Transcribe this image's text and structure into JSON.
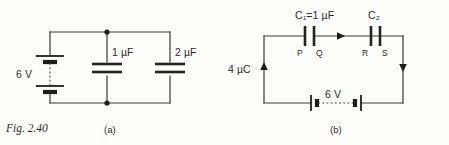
{
  "figure": {
    "caption": "Fig. 2.40",
    "background_color": "#fdfdfc",
    "ink_color": "#2b2b2b"
  },
  "circuit_a": {
    "part_label": "(a)",
    "battery": {
      "voltage_label": "6 V",
      "cells": 2,
      "style": "two-cell-dashed"
    },
    "capacitors": [
      {
        "id": "C-left",
        "value": "1",
        "unit": "µF",
        "label": "1 µF"
      },
      {
        "id": "C-right",
        "value": "2",
        "unit": "µF",
        "label": "2 µF"
      }
    ],
    "nodes": [
      {
        "id": "top-node"
      },
      {
        "id": "bottom-node"
      }
    ],
    "topology": "battery in parallel with 1 uF and 2 uF capacitors"
  },
  "circuit_b": {
    "part_label": "(b)",
    "charge_label": "4 µC",
    "battery": {
      "voltage_label": "6 V",
      "cells": 2,
      "style": "two-cell-dashed"
    },
    "capacitors": [
      {
        "id": "C1",
        "name": "C",
        "subscript": "1",
        "equals": "=1",
        "unit": "µF",
        "label": "C₁=1 µF",
        "plate_left_label": "P",
        "plate_right_label": "Q"
      },
      {
        "id": "C2",
        "name": "C",
        "subscript": "2",
        "equals": "",
        "unit": "",
        "label": "C₂",
        "plate_left_label": "R",
        "plate_right_label": "S"
      }
    ],
    "current_arrows": [
      {
        "id": "arrow-top",
        "direction": "right"
      },
      {
        "id": "arrow-right",
        "direction": "down"
      },
      {
        "id": "arrow-left",
        "direction": "up"
      }
    ],
    "topology": "series loop: C1 and C2 in series with 6 V battery"
  }
}
